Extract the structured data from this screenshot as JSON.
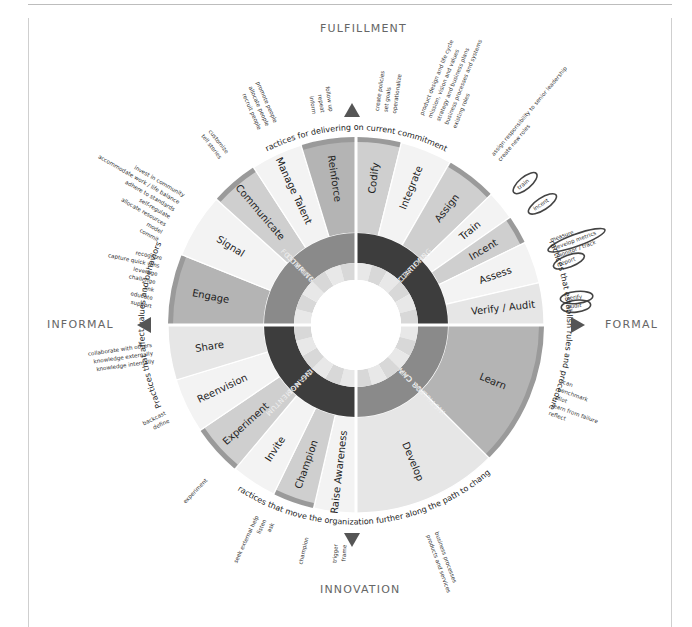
{
  "axes": {
    "top": "FULFILLMENT",
    "bottom": "INNOVATION",
    "left": "INFORMAL",
    "right": "FORMAL"
  },
  "colors": {
    "arrow": "#555555",
    "outline": "#444444",
    "ring_dark": "#3d3d3d",
    "ring_mid": "#8a8a8a",
    "seg_dark": "#b4b4b4",
    "seg_mid": "#cfcfcf",
    "seg_light": "#e6e6e6",
    "seg_xlight": "#f3f3f3",
    "rim": "#9a9a9a"
  },
  "arc_captions": {
    "top": "Practices for delivering on current commitments",
    "right": "Practices that establish rules and procedures",
    "bottom": "Practices that move the organization further along the path to change",
    "left": "Practices that affect values and behaviors"
  },
  "quadrants": [
    {
      "name": "CLARIFYING EXPECTATIONS",
      "lines": [
        "CLARIFYING",
        "EXPECTATIONS"
      ],
      "tone": "ring_dark",
      "start": 0,
      "end": 90
    },
    {
      "name": "INSTILLING CAPACITY FOR CHANGE",
      "lines": [
        "INSTILLING CAPACITY",
        "FOR CHANGE"
      ],
      "tone": "ring_mid",
      "start": 90,
      "end": 180
    },
    {
      "name": "BUILDING MOMENTUM FOR CHANGE",
      "lines": [
        "BUILDING MOMENTUM",
        "FOR CHANGE"
      ],
      "tone": "ring_dark",
      "start": 180,
      "end": 270
    },
    {
      "name": "FOSTERING COMMITMENT",
      "lines": [
        "FOSTERING",
        "COMMITMENT"
      ],
      "tone": "ring_mid",
      "start": 270,
      "end": 360
    }
  ],
  "segments": [
    {
      "label": "Codify",
      "start": 0,
      "end": 14,
      "tone": "seg_mid"
    },
    {
      "label": "Integrate",
      "start": 14,
      "end": 30,
      "tone": "seg_xlight"
    },
    {
      "label": "Assign",
      "start": 30,
      "end": 46,
      "tone": "seg_mid"
    },
    {
      "label": "Train",
      "start": 46,
      "end": 55,
      "tone": "seg_xlight"
    },
    {
      "label": "Incent",
      "start": 55,
      "end": 64,
      "tone": "seg_mid"
    },
    {
      "label": "Assess",
      "start": 64,
      "end": 77,
      "tone": "seg_xlight"
    },
    {
      "label": "Verify / Audit",
      "start": 77,
      "end": 90,
      "tone": "seg_light"
    },
    {
      "label": "Learn",
      "start": 90,
      "end": 135,
      "tone": "seg_dark"
    },
    {
      "label": "Develop",
      "start": 135,
      "end": 180,
      "tone": "seg_light"
    },
    {
      "label": "Raise Awareness",
      "start": 180,
      "end": 193,
      "tone": "seg_xlight"
    },
    {
      "label": "Champion",
      "start": 193,
      "end": 206,
      "tone": "seg_mid"
    },
    {
      "label": "Invite",
      "start": 206,
      "end": 220,
      "tone": "seg_xlight"
    },
    {
      "label": "Experiment",
      "start": 220,
      "end": 236,
      "tone": "seg_mid"
    },
    {
      "label": "Reenvision",
      "start": 236,
      "end": 253,
      "tone": "seg_xlight"
    },
    {
      "label": "Share",
      "start": 253,
      "end": 270,
      "tone": "seg_light"
    },
    {
      "label": "Engage",
      "start": 270,
      "end": 292,
      "tone": "seg_dark"
    },
    {
      "label": "Signal",
      "start": 292,
      "end": 312,
      "tone": "seg_xlight"
    },
    {
      "label": "Communicate",
      "start": 312,
      "end": 327,
      "tone": "seg_mid"
    },
    {
      "label": "Manage Talent",
      "start": 327,
      "end": 343,
      "tone": "seg_xlight"
    },
    {
      "label": "Reinforce",
      "start": 343,
      "end": 360,
      "tone": "seg_dark"
    }
  ],
  "note_groups": [
    {
      "anchor": "Reinforce",
      "angle": -9,
      "r": 215,
      "items": [
        "inform",
        "repeat",
        "follow up"
      ]
    },
    {
      "anchor": "Codify",
      "angle": 8,
      "r": 215,
      "items": [
        "create policies",
        "set goals",
        "operationalize"
      ]
    },
    {
      "anchor": "Manage Talent",
      "angle": -24,
      "r": 218,
      "items": [
        "recruit people",
        "allocate people",
        "promote people"
      ]
    },
    {
      "anchor": "Integrate",
      "angle": 22,
      "r": 220,
      "items": [
        "product design and life cycle",
        "mission, vision and values",
        "strategy and business plans",
        "business processes and systems",
        "existing roles"
      ]
    },
    {
      "anchor": "Assign",
      "angle": 40,
      "r": 218,
      "items": [
        "assign responsibility to senior leadership",
        "create new roles"
      ]
    },
    {
      "anchor": "Communicate",
      "angle": -38,
      "r": 215,
      "items": [
        "tell stories",
        "customize"
      ]
    },
    {
      "anchor": "Signal",
      "angle": -60,
      "r": 215,
      "items": [
        "commit",
        "model",
        "allocate resources",
        "self-regulate",
        "adhere to standards",
        "accommodate work / life balance",
        "invest in community"
      ]
    },
    {
      "anchor": "Engage",
      "angle": -78,
      "r": 205,
      "items": [
        "support",
        "educate",
        "link",
        "challenge",
        "leverage",
        "capture quick wins",
        "recognize"
      ]
    },
    {
      "anchor": "Share",
      "angle": -98,
      "r": 205,
      "items": [
        "knowledge internally",
        "knowledge externally",
        "collaborate with others"
      ]
    },
    {
      "anchor": "Reenvision",
      "angle": -116,
      "r": 210,
      "items": [
        "define",
        "backcast"
      ]
    },
    {
      "anchor": "Experiment",
      "angle": -136,
      "r": 215,
      "items": [
        "experiment"
      ]
    },
    {
      "anchor": "Invite",
      "angle": -155,
      "r": 215,
      "items": [
        "ask",
        "listen",
        "seek external help"
      ]
    },
    {
      "anchor": "Champion",
      "angle": -167,
      "r": 218,
      "items": [
        "champion"
      ]
    },
    {
      "anchor": "Raise Awareness",
      "angle": -176,
      "r": 220,
      "items": [
        "frame",
        "trigger"
      ]
    },
    {
      "anchor": "Develop",
      "angle": 160,
      "r": 222,
      "items": [
        "business processes",
        "products and services"
      ]
    },
    {
      "anchor": "Learn",
      "angle": 110,
      "r": 212,
      "items": [
        "scan",
        "benchmark",
        "pilot",
        "learn from failure",
        "reflect"
      ]
    },
    {
      "anchor": "Verify / Audit",
      "angle": 84,
      "r": 212,
      "items": [
        "verify",
        "audit"
      ]
    },
    {
      "anchor": "Assess",
      "angle": 70,
      "r": 212,
      "items": [
        "measure",
        "develop metrics",
        "monitor / track",
        "report"
      ]
    },
    {
      "anchor": "Incent",
      "angle": 57,
      "r": 212,
      "items": [
        "incent"
      ]
    },
    {
      "anchor": "Train",
      "angle": 50,
      "r": 212,
      "items": [
        "train"
      ]
    }
  ],
  "highlighted_notes": [
    "train",
    "incent",
    "develop metrics",
    "report",
    "verify",
    "audit"
  ]
}
